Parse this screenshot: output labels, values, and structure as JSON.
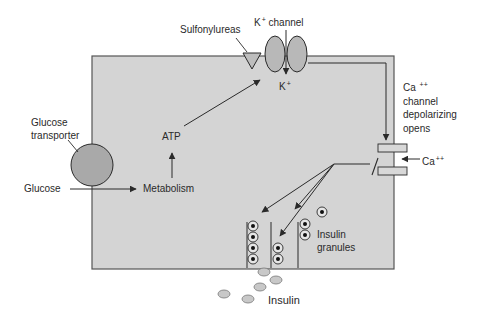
{
  "colors": {
    "cell_fill": "#d4d4d4",
    "cell_border": "#555555",
    "transporter_fill": "#a9a9a9",
    "channel_fill": "#b8b8b8",
    "granule_fill": "#e6e6e6",
    "insulin_fill": "#c8c8c8",
    "line": "#2a2a2a"
  },
  "labels": {
    "sulfonylureas": "Sulfonylureas",
    "k_channel_ion": "K",
    "k_channel_charge": "+",
    "k_channel_word": "channel",
    "k_ion": "K",
    "k_ion_charge": "+",
    "ca_channel_line1_ion": "Ca",
    "ca_channel_line1_charge": "++",
    "ca_channel_line2": "channel",
    "ca_channel_line3": "depolarizing",
    "ca_channel_line4": "opens",
    "ca_ion": "Ca",
    "ca_ion_charge": "++",
    "glucose_transporter_line1": "Glucose",
    "glucose_transporter_line2": "transporter",
    "glucose": "Glucose",
    "metabolism": "Metabolism",
    "atp": "ATP",
    "insulin_granules_line1": "Insulin",
    "insulin_granules_line2": "granules",
    "insulin": "Insulin"
  }
}
